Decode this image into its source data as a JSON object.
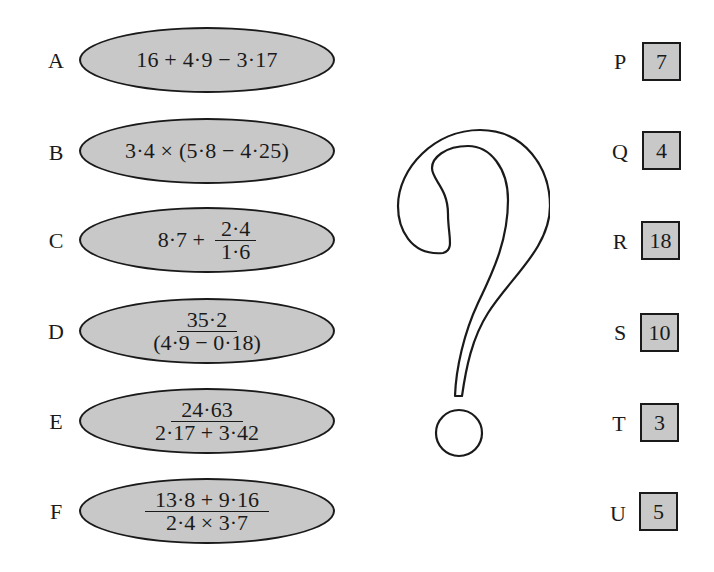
{
  "puzzle": {
    "description": "Match each calculation (A–F) to its answer (P–U)",
    "expressions": [
      {
        "label": "A",
        "type": "inline",
        "text": "16 + 4·9 − 3·17"
      },
      {
        "label": "B",
        "type": "inline",
        "text": "3·4 × (5·8 − 4·25)"
      },
      {
        "label": "C",
        "type": "mixed",
        "prefix": "8·7 +",
        "numerator": "2·4",
        "denominator": "1·6"
      },
      {
        "label": "D",
        "type": "fraction",
        "numerator": "35·2",
        "denominator": "(4·9 − 0·18)"
      },
      {
        "label": "E",
        "type": "fraction",
        "numerator": "24·63",
        "denominator": "2·17 + 3·42"
      },
      {
        "label": "F",
        "type": "fraction",
        "numerator": "13·8 + 9·16",
        "denominator": "2·4 × 3·7"
      }
    ],
    "answers": [
      {
        "label": "P",
        "value": "7"
      },
      {
        "label": "Q",
        "value": "4"
      },
      {
        "label": "R",
        "value": "18"
      },
      {
        "label": "S",
        "value": "10"
      },
      {
        "label": "T",
        "value": "3"
      },
      {
        "label": "U",
        "value": "5"
      }
    ],
    "center_symbol": "question-mark",
    "colors": {
      "fill": "#c8c8c8",
      "stroke": "#1a1a1a",
      "background": "#ffffff"
    }
  }
}
